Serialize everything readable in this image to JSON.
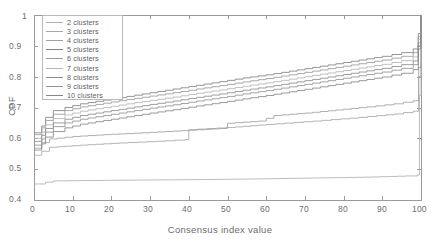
{
  "chart_data": {
    "type": "line",
    "title": "",
    "xlabel": "Consensus index value",
    "ylabel": "CDF",
    "xlim": [
      0,
      100
    ],
    "ylim": [
      0.4,
      1
    ],
    "xticks": [
      0,
      10,
      20,
      30,
      40,
      50,
      60,
      70,
      80,
      90,
      100
    ],
    "xticklabels": [
      "0",
      "10",
      "20",
      "30",
      "40",
      "50",
      "60",
      "70",
      "80",
      "90",
      "100"
    ],
    "yticks": [
      0.4,
      0.5,
      0.6,
      0.7,
      0.8,
      0.9,
      1
    ],
    "yticklabels": [
      "0.4",
      "0.5",
      "0.6",
      "0.7",
      "0.8",
      "0.9",
      "1"
    ],
    "grid": false,
    "legend_position": "upper-left",
    "step_shape": "post",
    "series": [
      {
        "name": "2  clusters",
        "color": "#b0b0b0",
        "x": [
          0,
          1,
          3,
          5,
          20,
          40,
          55,
          70,
          85,
          96,
          99,
          99.6,
          100
        ],
        "y": [
          0.452,
          0.452,
          0.458,
          0.462,
          0.464,
          0.466,
          0.468,
          0.471,
          0.474,
          0.478,
          0.481,
          0.74,
          1.0
        ]
      },
      {
        "name": "3  clusters",
        "color": "#a8a8a8",
        "x": [
          0,
          1,
          2,
          4,
          12,
          22,
          34,
          39,
          40,
          52,
          60,
          72,
          84,
          93,
          98,
          99.4,
          100
        ],
        "y": [
          0.545,
          0.545,
          0.558,
          0.571,
          0.578,
          0.585,
          0.592,
          0.596,
          0.628,
          0.637,
          0.645,
          0.656,
          0.668,
          0.679,
          0.688,
          0.8,
          1.0
        ]
      },
      {
        "name": "4  clusters",
        "color": "#a0a0a0",
        "x": [
          0,
          1,
          2,
          4,
          10,
          18,
          28,
          38,
          48,
          50,
          58,
          62,
          70,
          78,
          86,
          93,
          98,
          99.4,
          100
        ],
        "y": [
          0.568,
          0.568,
          0.586,
          0.598,
          0.606,
          0.612,
          0.618,
          0.625,
          0.632,
          0.649,
          0.656,
          0.674,
          0.682,
          0.692,
          0.702,
          0.712,
          0.722,
          0.83,
          1.0
        ]
      },
      {
        "name": "5  clusters",
        "color": "#838383",
        "x": [
          0,
          1,
          2,
          3,
          5,
          8,
          12,
          18,
          24,
          30,
          36,
          42,
          48,
          54,
          60,
          66,
          72,
          78,
          84,
          90,
          95,
          98,
          99.3,
          100
        ],
        "y": [
          0.618,
          0.618,
          0.64,
          0.668,
          0.69,
          0.7,
          0.712,
          0.724,
          0.736,
          0.748,
          0.76,
          0.772,
          0.784,
          0.796,
          0.806,
          0.818,
          0.83,
          0.842,
          0.854,
          0.866,
          0.878,
          0.89,
          0.94,
          1.0
        ]
      },
      {
        "name": "6  clusters",
        "color": "#9a9a9a",
        "x": [
          0,
          1,
          2,
          3,
          5,
          8,
          12,
          18,
          24,
          30,
          36,
          42,
          48,
          54,
          60,
          66,
          72,
          78,
          84,
          90,
          95,
          98,
          99.3,
          100
        ],
        "y": [
          0.612,
          0.612,
          0.634,
          0.658,
          0.678,
          0.69,
          0.702,
          0.714,
          0.726,
          0.737,
          0.748,
          0.76,
          0.771,
          0.783,
          0.794,
          0.806,
          0.818,
          0.83,
          0.842,
          0.854,
          0.866,
          0.878,
          0.93,
          1.0
        ]
      },
      {
        "name": "7  clusters",
        "color": "#b5b5b5",
        "x": [
          0,
          1,
          2,
          3,
          5,
          8,
          12,
          18,
          24,
          30,
          36,
          42,
          48,
          54,
          60,
          66,
          72,
          78,
          84,
          90,
          95,
          98,
          99.3,
          100
        ],
        "y": [
          0.6,
          0.6,
          0.62,
          0.644,
          0.664,
          0.676,
          0.688,
          0.7,
          0.712,
          0.723,
          0.734,
          0.746,
          0.757,
          0.769,
          0.78,
          0.792,
          0.804,
          0.816,
          0.828,
          0.84,
          0.852,
          0.864,
          0.92,
          1.0
        ]
      },
      {
        "name": "8  clusters",
        "color": "#8c8c8c",
        "x": [
          0,
          1,
          2,
          3,
          5,
          8,
          12,
          18,
          24,
          30,
          36,
          42,
          48,
          54,
          60,
          66,
          72,
          78,
          84,
          90,
          95,
          98,
          99.3,
          100
        ],
        "y": [
          0.59,
          0.59,
          0.61,
          0.632,
          0.65,
          0.662,
          0.674,
          0.686,
          0.698,
          0.71,
          0.721,
          0.733,
          0.744,
          0.756,
          0.767,
          0.779,
          0.791,
          0.803,
          0.815,
          0.827,
          0.839,
          0.851,
          0.91,
          1.0
        ]
      },
      {
        "name": "9  clusters",
        "color": "#939393",
        "x": [
          0,
          1,
          2,
          3,
          5,
          8,
          12,
          18,
          24,
          30,
          36,
          42,
          48,
          54,
          60,
          66,
          72,
          78,
          84,
          90,
          95,
          98,
          99.3,
          100
        ],
        "y": [
          0.578,
          0.578,
          0.598,
          0.62,
          0.638,
          0.65,
          0.662,
          0.674,
          0.686,
          0.698,
          0.709,
          0.721,
          0.732,
          0.744,
          0.755,
          0.767,
          0.779,
          0.791,
          0.803,
          0.815,
          0.827,
          0.839,
          0.9,
          1.0
        ]
      },
      {
        "name": "10  clusters",
        "color": "#888888",
        "x": [
          0,
          1,
          2,
          3,
          5,
          8,
          12,
          18,
          24,
          30,
          36,
          42,
          48,
          54,
          60,
          66,
          72,
          78,
          84,
          90,
          95,
          98,
          99.3,
          100
        ],
        "y": [
          0.562,
          0.562,
          0.582,
          0.604,
          0.622,
          0.634,
          0.646,
          0.658,
          0.67,
          0.682,
          0.693,
          0.705,
          0.716,
          0.728,
          0.739,
          0.751,
          0.763,
          0.775,
          0.787,
          0.799,
          0.811,
          0.823,
          0.89,
          1.0
        ]
      }
    ]
  },
  "axes": {
    "frame_color": "#9a9a9a",
    "tick_color": "#9a9a9a",
    "label_color": "#6d6d6d"
  },
  "legend": {
    "border_color": "#b9b9b9",
    "entries": [
      "2  clusters",
      "3  clusters",
      "4  clusters",
      "5  clusters",
      "6  clusters",
      "7  clusters",
      "8  clusters",
      "9  clusters",
      "10  clusters"
    ]
  }
}
